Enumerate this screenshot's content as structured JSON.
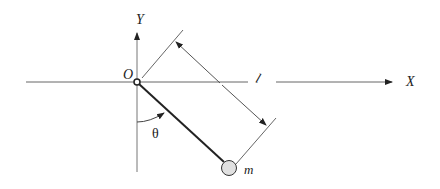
{
  "diagram": {
    "type": "pendulum",
    "labels": {
      "x_axis": "X",
      "y_axis": "Y",
      "origin": "O",
      "length": "l",
      "angle": "θ",
      "mass": "m"
    },
    "colors": {
      "axis": "#555555",
      "rod": "#222222",
      "mass_fill": "#e0e0e0",
      "mass_stroke": "#333333"
    }
  }
}
